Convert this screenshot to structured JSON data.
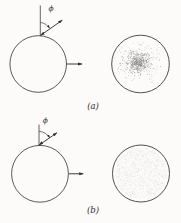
{
  "figure": {
    "background": "#fcfbf9",
    "ink_color": "#3d3d3d",
    "panels": [
      {
        "id": "a",
        "caption": "(a)",
        "angle_label": "ϕ",
        "scatter": {
          "type": "gaussian",
          "dots": 780,
          "dot_color": "#6f6f6f",
          "dot_radius": 0.42
        }
      },
      {
        "id": "b",
        "caption": "(b)",
        "angle_label": "ϕ",
        "scatter": {
          "type": "uniform",
          "dots": 1250,
          "dot_color": "#bdbdbd",
          "dot_radius": 0.3
        }
      }
    ]
  }
}
